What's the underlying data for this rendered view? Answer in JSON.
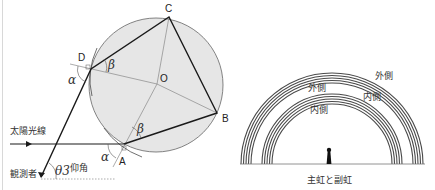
{
  "figure": {
    "top_caption_cut": "雨滴内の光の屈折と反射",
    "droplet": {
      "points": {
        "A": "A",
        "B": "B",
        "C": "C",
        "D": "D",
        "O": "O"
      },
      "angles": {
        "alpha_1": "α",
        "alpha_2": "α",
        "beta_1": "β",
        "beta_2": "β",
        "theta": "θ3"
      },
      "labels": {
        "sunlight": "太陽光線",
        "observer": "観測者",
        "elevation": "仰角"
      }
    },
    "rainbow": {
      "outer_label_secondary": "外側",
      "inner_label_secondary": "内側",
      "outer_label_primary": "外側",
      "inner_label_primary": "内側",
      "caption": "主虹と副虹"
    },
    "colors": {
      "droplet_fill": "#e6e6e6",
      "line": "#1a1a1a",
      "thin_line": "#777777",
      "band": "#555555"
    }
  }
}
